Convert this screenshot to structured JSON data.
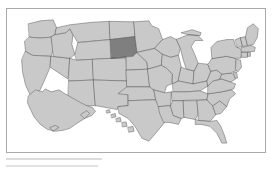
{
  "figure": {
    "type": "choropleth-map",
    "region": "United States",
    "border_color": "#a9a9a9",
    "background_color": "#ffffff"
  },
  "legend": {
    "highlight_fill": "#7f7f7f",
    "default_fill": "#c9c9c9",
    "border_stroke": "#4d4d4d"
  },
  "map_data": {
    "type": "choropleth",
    "title": "",
    "highlighted": [
      "South Dakota"
    ],
    "states": [
      {
        "id": "WA",
        "name": "Washington",
        "highlighted": false
      },
      {
        "id": "OR",
        "name": "Oregon",
        "highlighted": false
      },
      {
        "id": "CA",
        "name": "California",
        "highlighted": false
      },
      {
        "id": "NV",
        "name": "Nevada",
        "highlighted": false
      },
      {
        "id": "ID",
        "name": "Idaho",
        "highlighted": false
      },
      {
        "id": "MT",
        "name": "Montana",
        "highlighted": false
      },
      {
        "id": "WY",
        "name": "Wyoming",
        "highlighted": false
      },
      {
        "id": "UT",
        "name": "Utah",
        "highlighted": false
      },
      {
        "id": "AZ",
        "name": "Arizona",
        "highlighted": false
      },
      {
        "id": "CO",
        "name": "Colorado",
        "highlighted": false
      },
      {
        "id": "NM",
        "name": "New Mexico",
        "highlighted": false
      },
      {
        "id": "ND",
        "name": "North Dakota",
        "highlighted": false
      },
      {
        "id": "SD",
        "name": "South Dakota",
        "highlighted": true
      },
      {
        "id": "NE",
        "name": "Nebraska",
        "highlighted": false
      },
      {
        "id": "KS",
        "name": "Kansas",
        "highlighted": false
      },
      {
        "id": "OK",
        "name": "Oklahoma",
        "highlighted": false
      },
      {
        "id": "TX",
        "name": "Texas",
        "highlighted": false
      },
      {
        "id": "MN",
        "name": "Minnesota",
        "highlighted": false
      },
      {
        "id": "IA",
        "name": "Iowa",
        "highlighted": false
      },
      {
        "id": "MO",
        "name": "Missouri",
        "highlighted": false
      },
      {
        "id": "AR",
        "name": "Arkansas",
        "highlighted": false
      },
      {
        "id": "LA",
        "name": "Louisiana",
        "highlighted": false
      },
      {
        "id": "WI",
        "name": "Wisconsin",
        "highlighted": false
      },
      {
        "id": "IL",
        "name": "Illinois",
        "highlighted": false
      },
      {
        "id": "MI",
        "name": "Michigan",
        "highlighted": false
      },
      {
        "id": "IN",
        "name": "Indiana",
        "highlighted": false
      },
      {
        "id": "OH",
        "name": "Ohio",
        "highlighted": false
      },
      {
        "id": "KY",
        "name": "Kentucky",
        "highlighted": false
      },
      {
        "id": "TN",
        "name": "Tennessee",
        "highlighted": false
      },
      {
        "id": "MS",
        "name": "Mississippi",
        "highlighted": false
      },
      {
        "id": "AL",
        "name": "Alabama",
        "highlighted": false
      },
      {
        "id": "GA",
        "name": "Georgia",
        "highlighted": false
      },
      {
        "id": "FL",
        "name": "Florida",
        "highlighted": false
      },
      {
        "id": "SC",
        "name": "South Carolina",
        "highlighted": false
      },
      {
        "id": "NC",
        "name": "North Carolina",
        "highlighted": false
      },
      {
        "id": "VA",
        "name": "Virginia",
        "highlighted": false
      },
      {
        "id": "WV",
        "name": "West Virginia",
        "highlighted": false
      },
      {
        "id": "MD",
        "name": "Maryland",
        "highlighted": false
      },
      {
        "id": "DE",
        "name": "Delaware",
        "highlighted": false
      },
      {
        "id": "PA",
        "name": "Pennsylvania",
        "highlighted": false
      },
      {
        "id": "NJ",
        "name": "New Jersey",
        "highlighted": false
      },
      {
        "id": "NY",
        "name": "New York",
        "highlighted": false
      },
      {
        "id": "CT",
        "name": "Connecticut",
        "highlighted": false
      },
      {
        "id": "RI",
        "name": "Rhode Island",
        "highlighted": false
      },
      {
        "id": "MA",
        "name": "Massachusetts",
        "highlighted": false
      },
      {
        "id": "VT",
        "name": "Vermont",
        "highlighted": false
      },
      {
        "id": "NH",
        "name": "New Hampshire",
        "highlighted": false
      },
      {
        "id": "ME",
        "name": "Maine",
        "highlighted": false
      },
      {
        "id": "AK",
        "name": "Alaska",
        "highlighted": false
      },
      {
        "id": "HI",
        "name": "Hawaii",
        "highlighted": false
      }
    ]
  },
  "caption": {
    "line_1": "",
    "line_2": ""
  }
}
